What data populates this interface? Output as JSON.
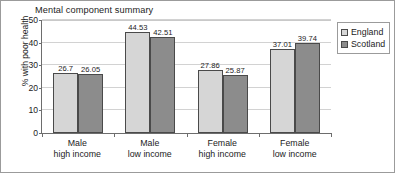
{
  "chart_data": {
    "type": "bar",
    "title": "Mental component summary",
    "xlabel": "",
    "ylabel": "% with poor health",
    "ylim": [
      0,
      50
    ],
    "yticks": [
      0,
      10,
      20,
      30,
      40,
      50
    ],
    "ytick_labels": [
      "0",
      "10",
      "20",
      "30",
      "40",
      "50"
    ],
    "grid": true,
    "legend_position": "right",
    "categories": [
      [
        "Male",
        "high income"
      ],
      [
        "Male",
        "low income"
      ],
      [
        "Female",
        "high income"
      ],
      [
        "Female",
        "low income"
      ]
    ],
    "series": [
      {
        "name": "England",
        "color": "#d6d6d6",
        "values": [
          26.7,
          44.53,
          27.86,
          37.01
        ],
        "labels": [
          "26.7",
          "44.53",
          "27.86",
          "37.01"
        ]
      },
      {
        "name": "Scotland",
        "color": "#8c8c8c",
        "values": [
          26.05,
          42.51,
          25.87,
          39.74
        ],
        "labels": [
          "26.05",
          "42.51",
          "25.87",
          "39.74"
        ]
      }
    ]
  }
}
